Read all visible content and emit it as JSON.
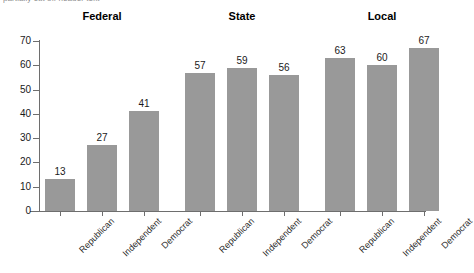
{
  "top_caption": "partially cut off header text",
  "chart_data": {
    "type": "bar",
    "title": "",
    "xlabel": "",
    "ylabel": "",
    "ylim": [
      0,
      70
    ],
    "ytick_values": [
      0,
      10,
      20,
      30,
      40,
      50,
      60,
      70
    ],
    "ytick_labels": [
      "0",
      "10",
      "20",
      "30",
      "40",
      "50",
      "60",
      "70"
    ],
    "grid": false,
    "legend": "none",
    "bar_color": "#999999",
    "axis_color": "#6e6e6e",
    "group_labels": [
      "Federal",
      "State",
      "Local"
    ],
    "categories": [
      "Republican",
      "Independent",
      "Democrat"
    ],
    "groups": [
      {
        "label": "Federal",
        "bars": [
          {
            "category": "Republican",
            "value": 13,
            "value_label": "13"
          },
          {
            "category": "Independent",
            "value": 27,
            "value_label": "27"
          },
          {
            "category": "Democrat",
            "value": 41,
            "value_label": "41"
          }
        ]
      },
      {
        "label": "State",
        "bars": [
          {
            "category": "Republican",
            "value": 57,
            "value_label": "57"
          },
          {
            "category": "Independent",
            "value": 59,
            "value_label": "59"
          },
          {
            "category": "Democrat",
            "value": 56,
            "value_label": "56"
          }
        ]
      },
      {
        "label": "Local",
        "bars": [
          {
            "category": "Republican",
            "value": 63,
            "value_label": "63"
          },
          {
            "category": "Independent",
            "value": 60,
            "value_label": "60"
          },
          {
            "category": "Democrat",
            "value": 67,
            "value_label": "67"
          }
        ]
      }
    ]
  }
}
